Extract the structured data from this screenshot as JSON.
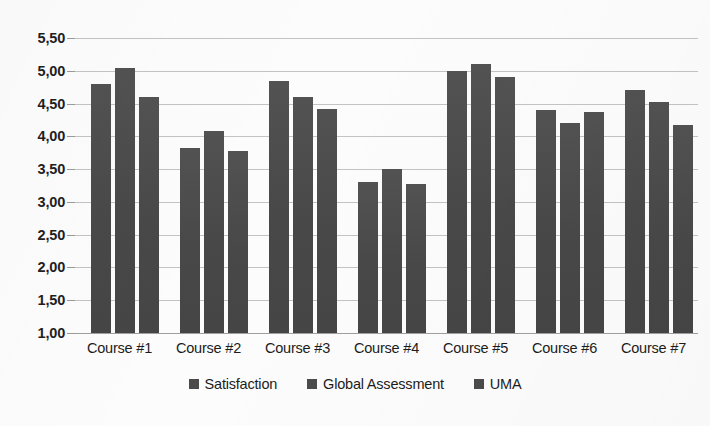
{
  "chart_data": {
    "type": "bar",
    "title": "",
    "subtitle": "",
    "xlabel": "",
    "ylabel": "",
    "categories": [
      "Course #1",
      "Course #2",
      "Course #3",
      "Course #4",
      "Course #5",
      "Course #6",
      "Course #7"
    ],
    "series": [
      {
        "name": "Satisfaction",
        "color": "#4b4b4b",
        "values": [
          4.8,
          3.82,
          4.85,
          3.3,
          5.0,
          4.4,
          4.71
        ]
      },
      {
        "name": "Global Assessment",
        "color": "#4b4b4b",
        "values": [
          5.05,
          4.08,
          4.6,
          3.5,
          5.1,
          4.21,
          4.52
        ]
      },
      {
        "name": "UMA",
        "color": "#4b4b4b",
        "values": [
          4.6,
          3.78,
          4.42,
          3.28,
          4.9,
          4.37,
          4.18
        ]
      }
    ],
    "ylim": [
      1.0,
      5.5
    ],
    "ytick_values": [
      5.5,
      5.0,
      4.5,
      4.0,
      3.5,
      3.0,
      2.5,
      2.0,
      1.5,
      1.0
    ],
    "ytick_labels": [
      "5,50",
      "5,00",
      "4,50",
      "4,00",
      "3,50",
      "3,00",
      "2,50",
      "2,00",
      "1,50",
      "1,00"
    ],
    "decimal_separator": ",",
    "grid": true,
    "grid_axis": "y",
    "legend_position": "bottom",
    "background_color": "#fcfcfc",
    "gridline_color": "#b9b9b9",
    "bar_color": "#4b4b4b"
  },
  "legend": {
    "items": [
      {
        "label": "Satisfaction"
      },
      {
        "label": "Global Assessment"
      },
      {
        "label": "UMA"
      }
    ]
  }
}
